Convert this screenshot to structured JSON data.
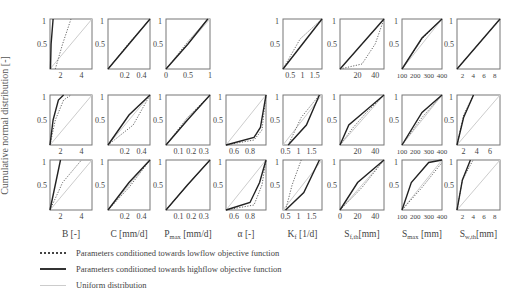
{
  "chart_data": {
    "type": "line",
    "title": "",
    "ylabel": "Cumulative normal distribution [-]",
    "grid": false,
    "legend": {
      "position": "bottom-left",
      "entries": [
        {
          "label": "Parameters conditioned towards lowflow objective function",
          "style": "dotted"
        },
        {
          "label": "Parameters conditioned towards highflow objective function",
          "style": "solid"
        },
        {
          "label": "Uniform distribution",
          "style": "light-solid"
        }
      ]
    },
    "columns": [
      {
        "key": "B",
        "xlabel": "B [-]",
        "xticks": [
          "2",
          "4"
        ]
      },
      {
        "key": "C",
        "xlabel": "C [mm/d]",
        "xticks": [
          "0.2",
          "0.4"
        ]
      },
      {
        "key": "Pmax",
        "xlabel": "Pmax [mm/d]",
        "xticks": [
          "0.1",
          "0.2",
          "0.3"
        ]
      },
      {
        "key": "alpha",
        "xlabel": "α [-]",
        "xticks": [
          "0.6",
          "0.8"
        ]
      },
      {
        "key": "Kf",
        "xlabel": "Kf [1/d]",
        "xticks": [
          "0.5",
          "1",
          "1.5"
        ]
      },
      {
        "key": "Sf_th",
        "xlabel": "Sf,th [mm]",
        "xticks": [
          "0",
          "20",
          "40"
        ]
      },
      {
        "key": "Smax",
        "xlabel": "Smax [mm]",
        "xticks": [
          "100",
          "200",
          "300",
          "400"
        ]
      },
      {
        "key": "Sw_th",
        "xlabel": "Sw,th [mm]",
        "xticks": [
          "2",
          "4",
          "6",
          "8"
        ]
      }
    ],
    "yticks": [
      "0.5",
      "1"
    ],
    "rows": [
      {
        "row": 1,
        "panels": [
          {
            "col": "B",
            "xticks": [
              "2",
              "4"
            ],
            "xlim": [
              1,
              5
            ],
            "dotted": [
              [
                1.5,
                0
              ],
              [
                2.2,
                0.5
              ],
              [
                3,
                1
              ]
            ],
            "solid": [
              [
                1.05,
                0
              ],
              [
                1.1,
                0.5
              ],
              [
                1.3,
                1
              ]
            ]
          },
          {
            "col": "C",
            "xticks": [
              "0.2",
              "0.4"
            ],
            "xlim": [
              0,
              0.5
            ],
            "dotted": [
              [
                0,
                0
              ],
              [
                0.25,
                0.52
              ],
              [
                0.5,
                1
              ]
            ],
            "solid": [
              [
                0,
                0
              ],
              [
                0.25,
                0.5
              ],
              [
                0.5,
                1
              ]
            ]
          },
          {
            "col": "Pmax",
            "xticks": [
              "0",
              "0.5",
              "1"
            ],
            "xlim": [
              0,
              1
            ],
            "dotted": [
              [
                0,
                0
              ],
              [
                0.5,
                0.55
              ],
              [
                0.95,
                1
              ]
            ],
            "solid": [
              [
                0,
                0
              ],
              [
                0.5,
                0.5
              ],
              [
                0.95,
                1
              ]
            ]
          },
          {
            "col": "alpha",
            "empty": true
          },
          {
            "col": "Kf",
            "xticks": [
              "0.5",
              "1",
              "1.5"
            ],
            "xlim": [
              0.2,
              1.8
            ],
            "dotted": [
              [
                0.2,
                0
              ],
              [
                0.9,
                0.6
              ],
              [
                1.8,
                1
              ]
            ],
            "solid": [
              [
                0.2,
                0
              ],
              [
                1,
                0.5
              ],
              [
                1.8,
                1
              ]
            ]
          },
          {
            "col": "Sf_th",
            "xticks": [
              "20",
              "40"
            ],
            "xlim": [
              0,
              50
            ],
            "dotted": [
              [
                0,
                0
              ],
              [
                25,
                0.1
              ],
              [
                40,
                0.5
              ],
              [
                50,
                1
              ]
            ],
            "solid": [
              [
                0,
                0
              ],
              [
                25,
                0.5
              ],
              [
                50,
                1
              ]
            ]
          },
          {
            "col": "Smax",
            "xticks": [
              "100",
              "200",
              "300",
              "400"
            ],
            "xlim": [
              100,
              400
            ],
            "dotted": [
              [
                100,
                0
              ],
              [
                250,
                0.6
              ],
              [
                400,
                1
              ]
            ],
            "solid": [
              [
                100,
                0
              ],
              [
                250,
                0.62
              ],
              [
                400,
                1
              ]
            ]
          },
          {
            "col": "Sw_th",
            "xticks": [
              "2",
              "4",
              "6",
              "8"
            ],
            "xlim": [
              1,
              9
            ],
            "dotted": [
              [
                1,
                0
              ],
              [
                5,
                0.5
              ],
              [
                9,
                1
              ]
            ],
            "solid": [
              [
                1,
                0
              ],
              [
                5,
                0.5
              ],
              [
                9,
                1
              ]
            ]
          }
        ]
      },
      {
        "row": 2,
        "panels": [
          {
            "col": "B",
            "xticks": [
              "2",
              "4"
            ],
            "xlim": [
              1,
              5
            ],
            "dotted": [
              [
                1,
                0
              ],
              [
                1.5,
                0.5
              ],
              [
                2.3,
                0.9
              ],
              [
                3,
                1
              ]
            ],
            "solid": [
              [
                1,
                0
              ],
              [
                1.3,
                0.5
              ],
              [
                1.8,
                0.9
              ],
              [
                2.3,
                1
              ]
            ]
          },
          {
            "col": "C",
            "xticks": [
              "0.2",
              "0.4"
            ],
            "xlim": [
              0,
              0.5
            ],
            "dotted": [
              [
                0,
                0
              ],
              [
                0.3,
                0.4
              ],
              [
                0.5,
                1
              ]
            ],
            "solid": [
              [
                0,
                0
              ],
              [
                0.25,
                0.6
              ],
              [
                0.5,
                1
              ]
            ]
          },
          {
            "col": "Pmax",
            "xticks": [
              "0.1",
              "0.2",
              "0.3"
            ],
            "xlim": [
              0,
              0.35
            ],
            "dotted": [
              [
                0,
                0
              ],
              [
                0.17,
                0.55
              ],
              [
                0.35,
                1
              ]
            ],
            "solid": [
              [
                0,
                0
              ],
              [
                0.17,
                0.5
              ],
              [
                0.35,
                1
              ]
            ]
          },
          {
            "col": "alpha",
            "xticks": [
              "0.6",
              "0.8"
            ],
            "xlim": [
              0.5,
              1
            ],
            "dotted": [
              [
                0.5,
                0
              ],
              [
                0.85,
                0.1
              ],
              [
                0.95,
                0.3
              ],
              [
                1,
                1
              ]
            ],
            "solid": [
              [
                0.5,
                0
              ],
              [
                0.85,
                0.15
              ],
              [
                0.93,
                0.35
              ],
              [
                1,
                1
              ]
            ]
          },
          {
            "col": "Kf",
            "xticks": [
              "0.5",
              "1",
              "1.5"
            ],
            "xlim": [
              0.4,
              1.9
            ],
            "dotted": [
              [
                0.6,
                0
              ],
              [
                1.1,
                0.55
              ],
              [
                1.8,
                1
              ]
            ],
            "solid": [
              [
                0.6,
                0
              ],
              [
                1.3,
                0.4
              ],
              [
                1.8,
                1
              ]
            ]
          },
          {
            "col": "Sf_th",
            "xticks": [
              "20",
              "40"
            ],
            "xlim": [
              0,
              50
            ],
            "dotted": [
              [
                0,
                0
              ],
              [
                15,
                0.35
              ],
              [
                30,
                0.65
              ],
              [
                50,
                1
              ]
            ],
            "solid": [
              [
                0,
                0
              ],
              [
                10,
                0.4
              ],
              [
                30,
                0.7
              ],
              [
                50,
                1
              ]
            ]
          },
          {
            "col": "Smax",
            "xticks": [
              "100",
              "200",
              "300",
              "400"
            ],
            "xlim": [
              100,
              400
            ],
            "dotted": [
              [
                100,
                0
              ],
              [
                250,
                0.55
              ],
              [
                400,
                1
              ]
            ],
            "solid": [
              [
                100,
                0
              ],
              [
                250,
                0.65
              ],
              [
                400,
                1
              ]
            ]
          },
          {
            "col": "Sw_th",
            "xticks": [
              "2",
              "4",
              "6"
            ],
            "xlim": [
              1,
              7.5
            ],
            "dotted": [
              [
                1,
                0
              ],
              [
                2,
                0.6
              ],
              [
                3.5,
                1
              ]
            ],
            "solid": [
              [
                1,
                0
              ],
              [
                2,
                0.55
              ],
              [
                3.5,
                1
              ]
            ]
          }
        ]
      },
      {
        "row": 3,
        "panels": [
          {
            "col": "B",
            "xticks": [
              "2",
              "4"
            ],
            "xlim": [
              1,
              5
            ],
            "dotted": [
              [
                1,
                0
              ],
              [
                2.2,
                0.55
              ],
              [
                4,
                1
              ]
            ],
            "solid": [
              [
                1,
                0
              ],
              [
                1.6,
                0.6
              ],
              [
                2,
                1
              ]
            ]
          },
          {
            "col": "C",
            "xticks": [
              "0.2",
              "0.4"
            ],
            "xlim": [
              0,
              0.5
            ],
            "dotted": [
              [
                0,
                0
              ],
              [
                0.25,
                0.45
              ],
              [
                0.5,
                1
              ]
            ],
            "solid": [
              [
                0,
                0
              ],
              [
                0.25,
                0.55
              ],
              [
                0.5,
                1
              ]
            ]
          },
          {
            "col": "Pmax",
            "xticks": [
              "0.1",
              "0.2",
              "0.3"
            ],
            "xlim": [
              0,
              0.35
            ],
            "dotted": [
              [
                0,
                0
              ],
              [
                0.17,
                0.5
              ],
              [
                0.35,
                1
              ]
            ],
            "solid": [
              [
                0,
                0
              ],
              [
                0.17,
                0.5
              ],
              [
                0.35,
                1
              ]
            ]
          },
          {
            "col": "alpha",
            "xticks": [
              "0.6",
              "0.8"
            ],
            "xlim": [
              0.5,
              1
            ],
            "dotted": [
              [
                0.5,
                0
              ],
              [
                0.85,
                0.1
              ],
              [
                0.95,
                0.5
              ],
              [
                1,
                1
              ]
            ],
            "solid": [
              [
                0.5,
                0
              ],
              [
                0.8,
                0.15
              ],
              [
                0.92,
                0.55
              ],
              [
                1,
                1
              ]
            ]
          },
          {
            "col": "Kf",
            "xticks": [
              "0.5",
              "1",
              "1.5"
            ],
            "xlim": [
              0.4,
              1.9
            ],
            "dotted": [
              [
                0.5,
                0
              ],
              [
                0.75,
                0.5
              ],
              [
                1.1,
                1
              ]
            ],
            "solid": [
              [
                0.5,
                0
              ],
              [
                1.2,
                0.35
              ],
              [
                1.8,
                1
              ]
            ]
          },
          {
            "col": "Sf_th",
            "xticks": [
              "0",
              "20",
              "40"
            ],
            "xlim": [
              0,
              50
            ],
            "dotted": [
              [
                0,
                0
              ],
              [
                25,
                0.45
              ],
              [
                50,
                1
              ]
            ],
            "solid": [
              [
                0,
                0
              ],
              [
                20,
                0.55
              ],
              [
                50,
                1
              ]
            ]
          },
          {
            "col": "Smax",
            "xticks": [
              "100",
              "200",
              "300",
              "400"
            ],
            "xlim": [
              100,
              400
            ],
            "dotted": [
              [
                100,
                0
              ],
              [
                250,
                0.45
              ],
              [
                400,
                0.95
              ]
            ],
            "solid": [
              [
                100,
                0
              ],
              [
                170,
                0.55
              ],
              [
                300,
                0.95
              ],
              [
                400,
                1
              ]
            ]
          },
          {
            "col": "Sw_th",
            "xticks": [
              "2",
              "4",
              "6",
              "8"
            ],
            "xlim": [
              1,
              9
            ],
            "dotted": [
              [
                1,
                0
              ],
              [
                2,
                0.6
              ],
              [
                4,
                1
              ]
            ],
            "solid": [
              [
                1,
                0
              ],
              [
                2,
                0.6
              ],
              [
                3.5,
                1
              ]
            ]
          }
        ]
      }
    ]
  },
  "labels": {
    "ylabel": "Cumulative normal distribution [-]",
    "legend_low": "Parameters conditioned towards lowflow objective function",
    "legend_high": "Parameters conditioned towards highflow objective function",
    "legend_uniform": "Uniform distribution"
  }
}
